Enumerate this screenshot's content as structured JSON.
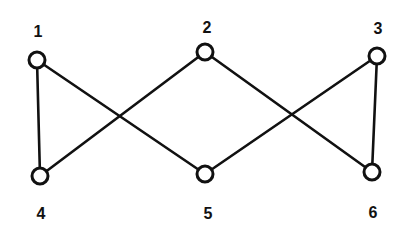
{
  "diagram": {
    "type": "graph",
    "colors": {
      "stroke": "#111111",
      "background": "#ffffff"
    },
    "nodes": [
      {
        "id": "1",
        "label": "1",
        "x": 37,
        "y": 60,
        "label_x": 38,
        "label_y": 37
      },
      {
        "id": "2",
        "label": "2",
        "x": 205,
        "y": 52,
        "label_x": 207,
        "label_y": 33
      },
      {
        "id": "3",
        "label": "3",
        "x": 377,
        "y": 56,
        "label_x": 378,
        "label_y": 34
      },
      {
        "id": "4",
        "label": "4",
        "x": 40,
        "y": 176,
        "label_x": 41,
        "label_y": 219
      },
      {
        "id": "5",
        "label": "5",
        "x": 205,
        "y": 174,
        "label_x": 208,
        "label_y": 219
      },
      {
        "id": "6",
        "label": "6",
        "x": 372,
        "y": 172,
        "label_x": 373,
        "label_y": 218
      }
    ],
    "edges": [
      {
        "from": "1",
        "to": "4"
      },
      {
        "from": "1",
        "to": "5"
      },
      {
        "from": "2",
        "to": "4"
      },
      {
        "from": "2",
        "to": "6"
      },
      {
        "from": "3",
        "to": "5"
      },
      {
        "from": "3",
        "to": "6"
      }
    ]
  }
}
